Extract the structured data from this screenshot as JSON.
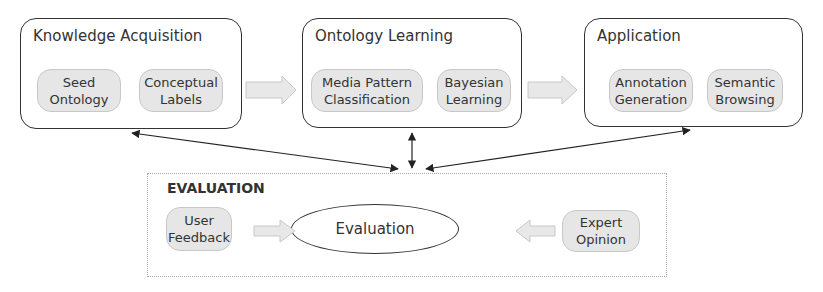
{
  "stages": [
    {
      "title": "Knowledge Acquisition",
      "items": [
        "Seed\nOntology",
        "Conceptual\nLabels"
      ]
    },
    {
      "title": "Ontology Learning",
      "items": [
        "Media Pattern\nClassification",
        "Bayesian\nLearning"
      ]
    },
    {
      "title": "Application",
      "items": [
        "Annotation\nGeneration",
        "Semantic\nBrowsing"
      ]
    }
  ],
  "evaluation": {
    "title": "EVALUATION",
    "center_label": "Evaluation",
    "left_input": "User\nFeedback",
    "right_input": "Expert\nOpinion"
  },
  "colors": {
    "pill_fill": "#e6e6e6",
    "arrow_fill": "#e8e8e8",
    "stroke": "#333333"
  }
}
